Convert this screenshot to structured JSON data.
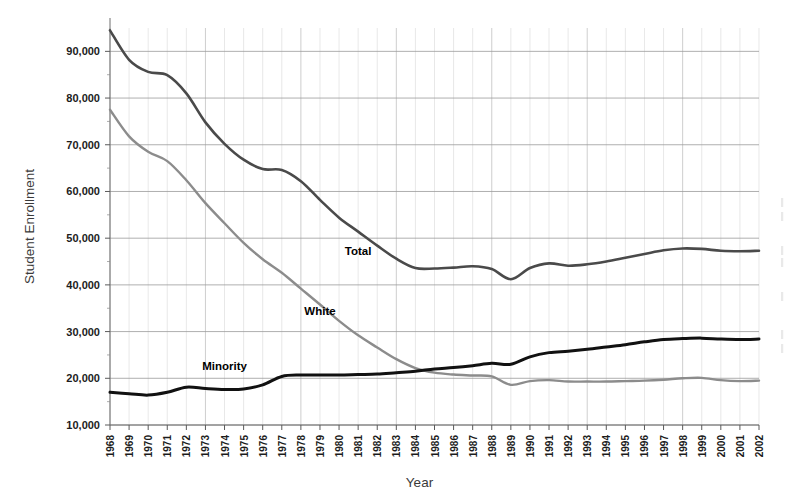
{
  "chart_data": {
    "type": "line",
    "title": "",
    "xlabel": "Year",
    "ylabel": "Student Enrollment",
    "grid": true,
    "legend_position": "inline-labels",
    "xlim": [
      1968,
      2002
    ],
    "ylim": [
      10000,
      95000
    ],
    "ytick_values": [
      10000,
      20000,
      30000,
      40000,
      50000,
      60000,
      70000,
      80000,
      90000
    ],
    "ytick_labels": [
      "10,000",
      "20,000",
      "30,000",
      "40,000",
      "50,000",
      "60,000",
      "70,000",
      "80,000",
      "90,000"
    ],
    "categories": [
      1968,
      1969,
      1970,
      1971,
      1972,
      1973,
      1974,
      1975,
      1976,
      1977,
      1978,
      1979,
      1980,
      1981,
      1982,
      1983,
      1984,
      1985,
      1986,
      1987,
      1988,
      1989,
      1990,
      1991,
      1992,
      1993,
      1994,
      1995,
      1996,
      1997,
      1998,
      1999,
      2000,
      2001,
      2002
    ],
    "xtick_labels": [
      "1968",
      "1969",
      "1970",
      "1971",
      "1972",
      "1973",
      "1974",
      "1975",
      "1976",
      "1977",
      "1978",
      "1979",
      "1980",
      "1981",
      "1982",
      "1983",
      "1984",
      "1985",
      "1986",
      "1987",
      "1988",
      "1989",
      "1990",
      "1991",
      "1992",
      "1993",
      "1994",
      "1995",
      "1996",
      "1997",
      "1998",
      "1999",
      "2000",
      "2001",
      "2002"
    ],
    "series": [
      {
        "name": "Total",
        "color": "#4a4a4a",
        "label_x": 1981,
        "label_y": 46500,
        "values": [
          94500,
          88200,
          85600,
          84900,
          81000,
          74800,
          70200,
          66800,
          64800,
          64600,
          62200,
          58200,
          54400,
          51400,
          48400,
          45600,
          43600,
          43500,
          43700,
          44000,
          43400,
          41200,
          43600,
          44600,
          44100,
          44400,
          45000,
          45800,
          46600,
          47400,
          47800,
          47700,
          47300,
          47200,
          47300
        ]
      },
      {
        "name": "White",
        "color": "#8c8c8c",
        "label_x": 1979,
        "label_y": 33500,
        "values": [
          77500,
          71800,
          68500,
          66500,
          62400,
          57500,
          53200,
          49000,
          45500,
          42600,
          39200,
          35800,
          32300,
          29200,
          26600,
          24100,
          22200,
          21200,
          20800,
          20600,
          20400,
          18600,
          19400,
          19600,
          19300,
          19300,
          19300,
          19400,
          19500,
          19700,
          20000,
          20100,
          19600,
          19400,
          19500
        ]
      },
      {
        "name": "Minority",
        "color": "#111111",
        "label_x": 1974,
        "label_y": 21700,
        "values": [
          17000,
          16700,
          16400,
          17000,
          18100,
          17800,
          17600,
          17700,
          18600,
          20400,
          20700,
          20700,
          20700,
          20800,
          20900,
          21200,
          21500,
          22000,
          22300,
          22700,
          23200,
          23000,
          24600,
          25500,
          25800,
          26200,
          26700,
          27200,
          27800,
          28300,
          28500,
          28600,
          28400,
          28300,
          28400
        ]
      }
    ]
  }
}
